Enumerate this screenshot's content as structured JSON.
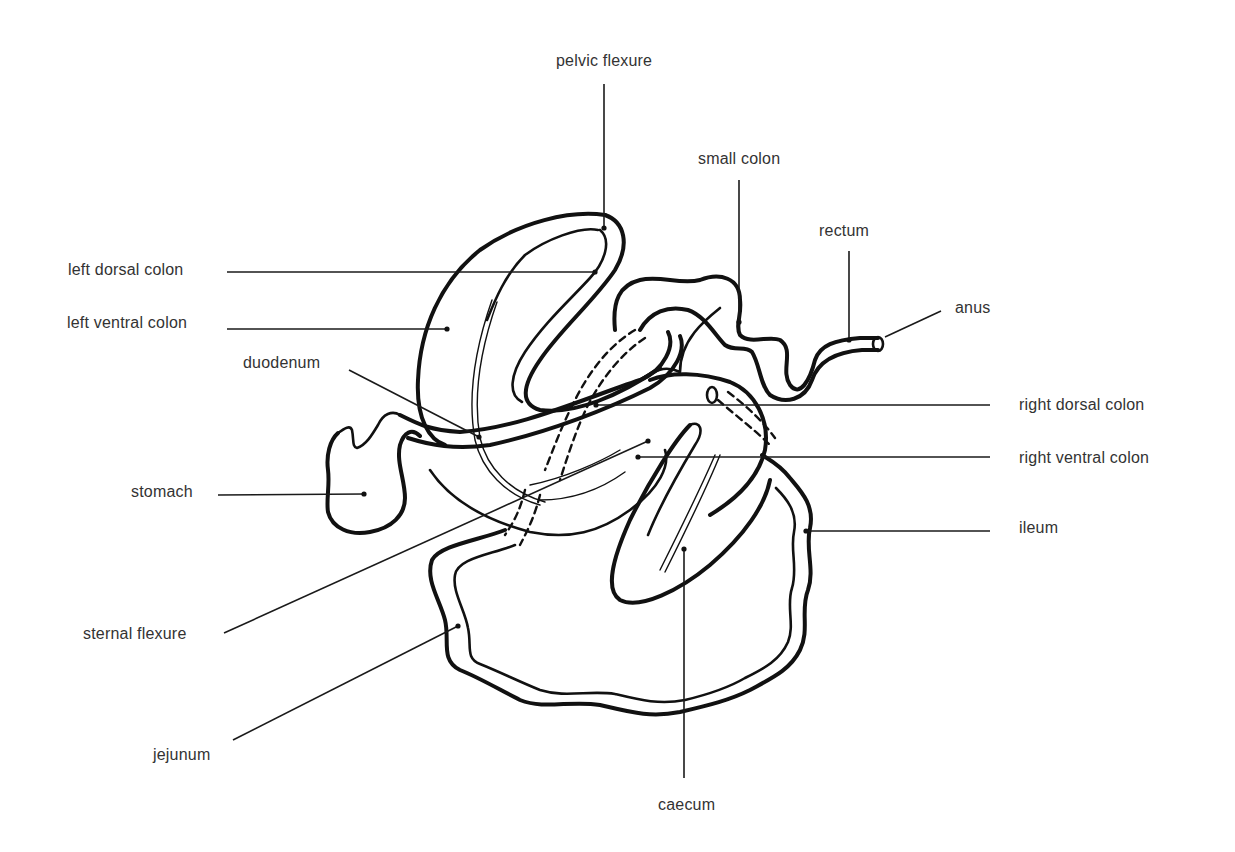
{
  "diagram": {
    "line_color": "#111111",
    "text_color": "#333333",
    "labels": {
      "pelvic_flexure": "pelvic flexure",
      "small_colon": "small colon",
      "rectum": "rectum",
      "anus": "anus",
      "left_dorsal_colon": "left dorsal colon",
      "left_ventral_colon": "left ventral colon",
      "duodenum": "duodenum",
      "right_dorsal_colon": "right dorsal colon",
      "right_ventral_colon": "right ventral colon",
      "stomach": "stomach",
      "ileum": "ileum",
      "sternal_flexure": "sternal flexure",
      "jejunum": "jejunum",
      "caecum": "caecum"
    }
  }
}
